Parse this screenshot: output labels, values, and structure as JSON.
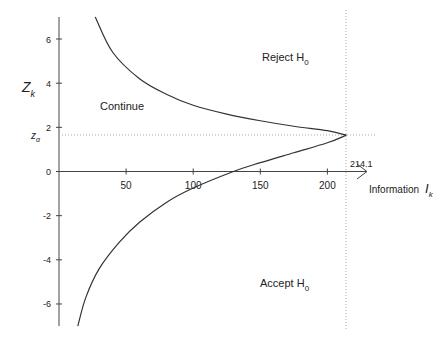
{
  "chart_data": {
    "type": "line",
    "title": "",
    "xlabel": "Information",
    "xlabel_symbol": "I",
    "xlabel_sub": "k",
    "ylabel": "Z",
    "ylabel_sub": "k",
    "xlim": [
      0,
      230
    ],
    "ylim": [
      -7,
      7
    ],
    "x_ticks": [
      50,
      100,
      150,
      200
    ],
    "y_ticks": [
      6,
      4,
      2,
      0,
      -2,
      -4,
      -6
    ],
    "grid": false,
    "reference_lines": {
      "z_alpha": {
        "label": "z",
        "sub": "α",
        "y": 1.645
      },
      "I_max": {
        "label": "214.1",
        "x": 214.1
      }
    },
    "regions": [
      {
        "label": "Continue",
        "x": 40,
        "y": 3
      },
      {
        "label": "Reject H",
        "sub": "0",
        "x": 150,
        "y": 4.6
      },
      {
        "label": "Accept H",
        "sub": "0",
        "x": 150,
        "y": -4.6
      }
    ],
    "series": [
      {
        "name": "upper boundary",
        "points": [
          [
            27,
            7
          ],
          [
            40,
            5.4
          ],
          [
            60,
            4.2
          ],
          [
            80,
            3.5
          ],
          [
            100,
            3.0
          ],
          [
            125,
            2.6
          ],
          [
            150,
            2.3
          ],
          [
            175,
            2.05
          ],
          [
            200,
            1.85
          ],
          [
            214.1,
            1.645
          ]
        ]
      },
      {
        "name": "lower boundary",
        "points": [
          [
            14,
            -7
          ],
          [
            20,
            -5.7
          ],
          [
            30,
            -4.4
          ],
          [
            45,
            -3.2
          ],
          [
            60,
            -2.3
          ],
          [
            80,
            -1.4
          ],
          [
            100,
            -0.75
          ],
          [
            130,
            0.0
          ],
          [
            150,
            0.4
          ],
          [
            175,
            0.85
          ],
          [
            200,
            1.3
          ],
          [
            214.1,
            1.645
          ]
        ]
      }
    ]
  }
}
